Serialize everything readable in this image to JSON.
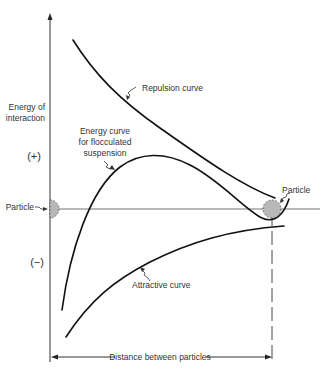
{
  "figure": {
    "y_axis_label_line1": "Energy of",
    "y_axis_label_line2": "interaction",
    "positive_sign": "(+)",
    "negative_sign": "(−)",
    "x_axis_label": "Distance between particles"
  },
  "labels": {
    "repulsion": "Repulsion curve",
    "flocculated_line1": "Energy curve",
    "flocculated_line2": "for flocculated",
    "flocculated_line3": "suspension",
    "attractive": "Attractive curve",
    "particle_left": "Particle",
    "particle_right": "Particle"
  },
  "colors": {
    "curve": "#111111",
    "particle_fill": "#b8b8b8",
    "baseline": "#777777",
    "text": "#333333"
  }
}
